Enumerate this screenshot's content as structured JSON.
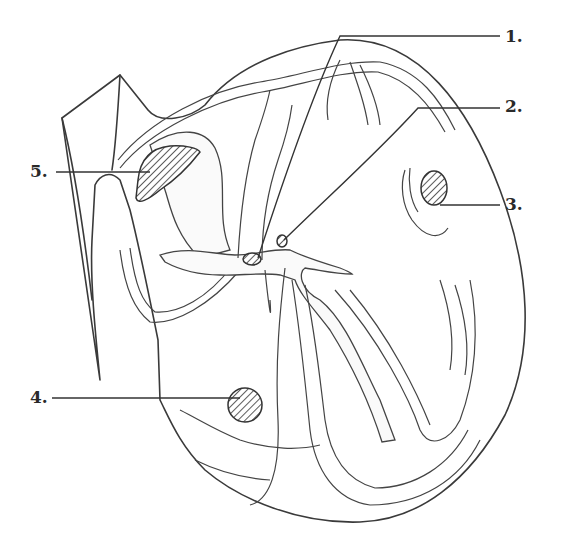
{
  "diagram": {
    "labels": [
      {
        "id": "1",
        "text": "1.",
        "x": 505,
        "y": 30,
        "points_to": "av-node"
      },
      {
        "id": "2",
        "text": "2.",
        "x": 505,
        "y": 98,
        "points_to": "bundle-of-his"
      },
      {
        "id": "3",
        "text": "3.",
        "x": 505,
        "y": 196,
        "points_to": "left-ventricle-spot"
      },
      {
        "id": "4",
        "text": "4.",
        "x": 32,
        "y": 389,
        "points_to": "right-ventricle-spot"
      },
      {
        "id": "5",
        "text": "5.",
        "x": 32,
        "y": 163,
        "points_to": "sa-node"
      }
    ],
    "colors": {
      "line": "#3a3a3a",
      "background": "#ffffff"
    }
  }
}
